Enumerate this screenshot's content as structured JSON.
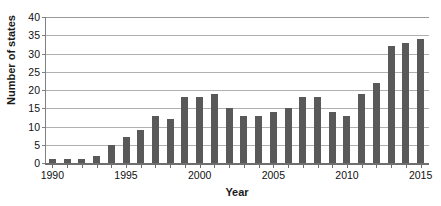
{
  "chart_data": {
    "type": "bar",
    "title": "",
    "xlabel": "Year",
    "ylabel": "Number of states",
    "categories": [
      "1990",
      "1991",
      "1992",
      "1993",
      "1994",
      "1995",
      "1996",
      "1997",
      "1998",
      "1999",
      "2000",
      "2001",
      "2002",
      "2003",
      "2004",
      "2005",
      "2006",
      "2007",
      "2008",
      "2009",
      "2010",
      "2011",
      "2012",
      "2013",
      "2014",
      "2015"
    ],
    "values": [
      1,
      1,
      1,
      2,
      5,
      7,
      9,
      13,
      12,
      18,
      18,
      19,
      15,
      13,
      13,
      14,
      15,
      18,
      18,
      14,
      13,
      19,
      22,
      32,
      33,
      34
    ],
    "ylim": [
      0,
      40
    ],
    "ytick_labels": [
      "0",
      "5",
      "10",
      "15",
      "20",
      "25",
      "30",
      "35",
      "40"
    ],
    "ytick_values": [
      0,
      5,
      10,
      15,
      20,
      25,
      30,
      35,
      40
    ],
    "xtick_labels": [
      "1990",
      "1995",
      "2000",
      "2005",
      "2010",
      "2015"
    ],
    "xtick_values": [
      1990,
      1995,
      2000,
      2005,
      2010,
      2015
    ],
    "grid": true,
    "legend": null,
    "bar_color": "#595959",
    "gridline_color": "#b0b0b0",
    "axis_color": "#6e6e6e",
    "background_color": "#ffffff"
  }
}
